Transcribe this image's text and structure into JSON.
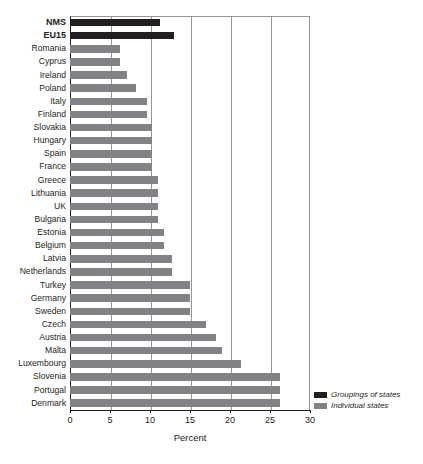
{
  "chart_data": {
    "type": "bar",
    "orientation": "horizontal",
    "title": "",
    "xlabel": "Percent",
    "ylabel": "",
    "xlim": [
      0,
      30
    ],
    "xticks": [
      0,
      5,
      10,
      15,
      20,
      25,
      30
    ],
    "xtick_labels": [
      "0",
      "5",
      "10",
      "15",
      "20",
      "25",
      "30"
    ],
    "grid": "vertical",
    "legend_position": "bottom-right",
    "legend": [
      {
        "label": "Groupings of states",
        "color": "#231f20",
        "key": "grouping"
      },
      {
        "label": "Individual states",
        "color": "#808285",
        "key": "individual"
      }
    ],
    "categories": [
      "NMS",
      "EU15",
      "Romania",
      "Cyprus",
      "Ireland",
      "Poland",
      "Italy",
      "Finland",
      "Slovakia",
      "Hungary",
      "Spain",
      "France",
      "Greece",
      "Lithuania",
      "UK",
      "Bulgaria",
      "Estonia",
      "Belgium",
      "Latvia",
      "Netherlands",
      "Turkey",
      "Germany",
      "Sweden",
      "Czech",
      "Austria",
      "Malta",
      "Luxembourg",
      "Slovenia",
      "Portugal",
      "Denmark"
    ],
    "values": [
      11.3,
      13.0,
      6.2,
      6.2,
      7.1,
      8.3,
      9.6,
      9.6,
      10.2,
      10.2,
      10.2,
      10.2,
      11.0,
      11.0,
      11.0,
      11.0,
      11.7,
      11.7,
      12.8,
      12.8,
      15.0,
      15.0,
      15.0,
      17.0,
      18.2,
      19.0,
      21.4,
      26.2,
      26.2,
      26.2
    ],
    "series_key": [
      "grouping",
      "grouping",
      "individual",
      "individual",
      "individual",
      "individual",
      "individual",
      "individual",
      "individual",
      "individual",
      "individual",
      "individual",
      "individual",
      "individual",
      "individual",
      "individual",
      "individual",
      "individual",
      "individual",
      "individual",
      "individual",
      "individual",
      "individual",
      "individual",
      "individual",
      "individual",
      "individual",
      "individual",
      "individual",
      "individual"
    ]
  }
}
